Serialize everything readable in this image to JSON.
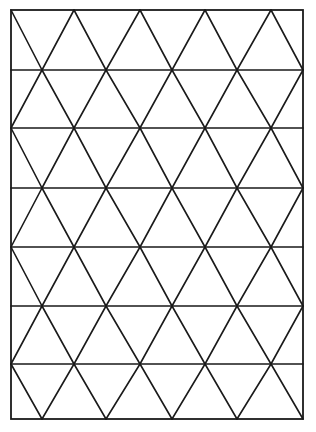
{
  "diagram": {
    "type": "triangular-grid",
    "canvas": {
      "width": 316,
      "height": 432,
      "background": "#ffffff"
    },
    "stroke_color": "#1a1a1a",
    "frame": {
      "left": 11,
      "top": 10,
      "right": 303,
      "bottom": 419
    },
    "rows": 7,
    "horizontal_lines_y": [
      10,
      70,
      128,
      188,
      247,
      306,
      364,
      419
    ],
    "vertices_even_row_x": [
      11,
      74,
      140,
      205,
      271
    ],
    "vertices_odd_row_x": [
      42,
      106,
      172,
      237,
      303
    ]
  }
}
